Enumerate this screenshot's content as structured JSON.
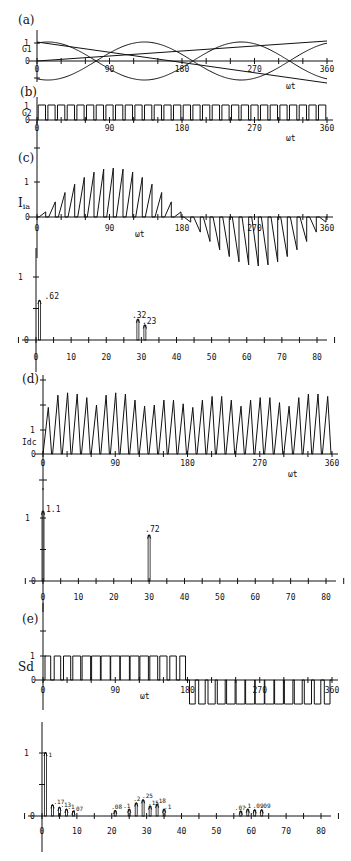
{
  "chart_data": [
    {
      "panel": "(a)",
      "type": "line",
      "ylabel": "G1",
      "xlabel": "",
      "x_ticks": [
        "0",
        "90",
        "180",
        "270",
        "360"
      ],
      "y_ticks": [
        "0",
        "1"
      ],
      "xlim": [
        0,
        360
      ],
      "series": [
        {
          "name": "carrier-1",
          "description": "sinusoid, 1.5 cycles over 0-360"
        },
        {
          "name": "carrier-2",
          "description": "sinusoid, inverted, 1.5 cycles over 0-360"
        },
        {
          "name": "reference",
          "description": "straight line rising from 0 at 0 deg to ~0.7 at 360 deg"
        }
      ]
    },
    {
      "panel": "(b)",
      "type": "line",
      "ylabel": "G2",
      "xlabel": "wt",
      "x_ticks": [
        "0",
        "90",
        "180",
        "270",
        "360"
      ],
      "y_ticks": [
        "0",
        "1"
      ],
      "xlim": [
        0,
        360
      ],
      "description": "gating pulse train, ~30 pulses between 0 and 1"
    },
    {
      "panel": "(c)",
      "type": "line",
      "ylabel": "Iia",
      "xlabel": "wt",
      "x_ticks": [
        "0",
        "90",
        "180",
        "270",
        "360"
      ],
      "y_ticks": [
        "0",
        "1"
      ],
      "xlim": [
        0,
        360
      ],
      "description": "sinusoidally modulated triangular pulses, positive peak ~1.45 near 90, negative peak ~-1.45 near 270"
    },
    {
      "panel": "(c) spectrum",
      "type": "bar",
      "xlabel": "harmonic order",
      "x_ticks": [
        "0",
        "10",
        "20",
        "30",
        "40",
        "50",
        "60",
        "70",
        "80"
      ],
      "y_ticks": [
        "0",
        "1"
      ],
      "xlim": [
        0,
        80
      ],
      "x": [
        1,
        29,
        31
      ],
      "values": [
        0.62,
        0.32,
        0.23
      ],
      "annotations": [
        ".62",
        ".32",
        ".23"
      ]
    },
    {
      "panel": "(d)",
      "type": "line",
      "ylabel": "Idc",
      "xlabel": "wt",
      "x_ticks": [
        "0",
        "90",
        "180",
        "270",
        "360"
      ],
      "y_ticks": [
        "0",
        "1"
      ],
      "xlim": [
        0,
        360
      ],
      "description": "DC link current, 30 triangular pulses with peaks between ~1.9 and ~2.5"
    },
    {
      "panel": "(d) spectrum",
      "type": "bar",
      "xlabel": "harmonic order",
      "x_ticks": [
        "0",
        "10",
        "20",
        "30",
        "40",
        "50",
        "60",
        "70",
        "80"
      ],
      "y_ticks": [
        "0",
        "1"
      ],
      "xlim": [
        0,
        80
      ],
      "x": [
        0,
        30
      ],
      "values": [
        1.1,
        0.72
      ],
      "annotations": [
        "1.1",
        ".72"
      ]
    },
    {
      "panel": "(e)",
      "type": "line",
      "ylabel": "Sd",
      "xlabel": "wt",
      "x_ticks": [
        "0",
        "90",
        "180",
        "270",
        "360"
      ],
      "y_ticks": [
        "0",
        "1"
      ],
      "xlim": [
        0,
        360
      ],
      "description": "switching function: pulses 0..1 for 0-180 deg, 0..-1 for 180-360 deg"
    },
    {
      "panel": "(e) spectrum",
      "type": "bar",
      "xlabel": "harmonic order",
      "x_ticks": [
        "0",
        "10",
        "20",
        "30",
        "40",
        "50",
        "60",
        "70",
        "80"
      ],
      "y_ticks": [
        "0",
        "1"
      ],
      "xlim": [
        0,
        80
      ],
      "x": [
        1,
        3,
        5,
        7,
        9,
        21,
        25,
        27,
        29,
        31,
        33,
        35,
        57,
        59,
        61,
        63
      ],
      "values": [
        1,
        0.17,
        0.13,
        0.1,
        0.07,
        0.08,
        0.1,
        0.2,
        0.25,
        0.15,
        0.18,
        0.1,
        0.07,
        0.1,
        0.09,
        0.09
      ],
      "annotations": [
        "1",
        ".17",
        ".13",
        ".1",
        ".07",
        ".08",
        ".1",
        ".2",
        ".25",
        ".15",
        ".18",
        ".1",
        ".07",
        ".1",
        ".09",
        ".09"
      ]
    }
  ],
  "labels": {
    "a": "(a)",
    "b": "(b)",
    "c": "(c)",
    "d": "(d)",
    "e": "(e)",
    "G1": "G1",
    "G2": "G2",
    "Iia": "I",
    "Iia_sub": "ia",
    "Idc": "Idc",
    "Sd": "Sd",
    "wt": "ωt",
    "one": "1",
    "zero": "0"
  }
}
